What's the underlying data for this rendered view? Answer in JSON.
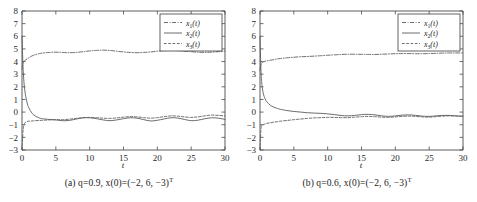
{
  "figure": {
    "panels": [
      {
        "tag": "(a)",
        "caption_text": "(a)  q=0.9, x(0)=(−2, 6, −3)",
        "caption_sup": "T",
        "q": 0.9
      },
      {
        "tag": "(b)",
        "caption_text": "(b)  q=0.6, x(0)=(−2, 6, −3)",
        "caption_sup": "T",
        "q": 0.6
      }
    ]
  },
  "legend": {
    "entries": [
      {
        "base": "x",
        "sub": "1",
        "suffix": "(t)",
        "style": "dashdot"
      },
      {
        "base": "x",
        "sub": "2",
        "suffix": "(t)",
        "style": "solid"
      },
      {
        "base": "x",
        "sub": "3",
        "suffix": "(t)",
        "style": "dashed"
      }
    ]
  },
  "axes": {
    "xlabel": "t",
    "ylabel": "",
    "xticks": [
      "0",
      "5",
      "10",
      "15",
      "20",
      "25",
      "30"
    ],
    "yticks": [
      "8",
      "7",
      "6",
      "5",
      "4",
      "3",
      "2",
      "1",
      "0",
      "−1",
      "−2",
      "−3"
    ],
    "xlim": [
      0,
      30
    ],
    "ylim": [
      -3,
      8
    ],
    "grid": false
  },
  "colors": {
    "axis": "#4a4a4a",
    "curve": "#5c5c5c",
    "text": "#1f1f1f",
    "background": "#ffffff"
  },
  "chart_data": [
    {
      "type": "line",
      "title": "(a) q=0.9, x(0)=(-2, 6, -3)T",
      "xlabel": "t",
      "ylabel": "",
      "xlim": [
        0,
        30
      ],
      "ylim": [
        -3,
        8
      ],
      "grid": false,
      "legend_position": "top-right",
      "x": [
        0,
        0.15,
        0.3,
        0.5,
        0.75,
        1,
        1.5,
        2,
        2.5,
        3,
        4,
        5,
        6,
        7,
        8,
        9,
        10,
        11,
        12,
        13,
        14,
        15,
        16,
        17,
        18,
        19,
        20,
        21,
        22,
        23,
        24,
        25,
        26,
        27,
        28,
        29,
        30
      ],
      "series": [
        {
          "name": "x1(t)",
          "style": "dashdot",
          "values": [
            3.4,
            3.85,
            4.0,
            4.12,
            4.2,
            4.3,
            4.45,
            4.55,
            4.62,
            4.67,
            4.72,
            4.74,
            4.72,
            4.7,
            4.72,
            4.78,
            4.84,
            4.88,
            4.9,
            4.88,
            4.82,
            4.76,
            4.72,
            4.7,
            4.72,
            4.76,
            4.82,
            4.86,
            4.88,
            4.86,
            4.82,
            4.78,
            4.74,
            4.72,
            4.74,
            4.78,
            4.82
          ]
        },
        {
          "name": "x2(t)",
          "style": "solid",
          "values": [
            6.0,
            3.6,
            2.3,
            1.4,
            0.75,
            0.35,
            -0.1,
            -0.32,
            -0.45,
            -0.52,
            -0.58,
            -0.62,
            -0.68,
            -0.66,
            -0.55,
            -0.46,
            -0.45,
            -0.52,
            -0.62,
            -0.68,
            -0.62,
            -0.52,
            -0.45,
            -0.48,
            -0.6,
            -0.7,
            -0.65,
            -0.54,
            -0.45,
            -0.47,
            -0.58,
            -0.68,
            -0.64,
            -0.53,
            -0.45,
            -0.48,
            -0.58
          ]
        },
        {
          "name": "x3(t)",
          "style": "dashed",
          "values": [
            -3.0,
            -1.5,
            -1.0,
            -0.82,
            -0.75,
            -0.72,
            -0.7,
            -0.68,
            -0.66,
            -0.65,
            -0.62,
            -0.6,
            -0.6,
            -0.56,
            -0.5,
            -0.44,
            -0.42,
            -0.44,
            -0.48,
            -0.5,
            -0.46,
            -0.4,
            -0.36,
            -0.38,
            -0.44,
            -0.48,
            -0.44,
            -0.36,
            -0.3,
            -0.32,
            -0.38,
            -0.42,
            -0.38,
            -0.3,
            -0.24,
            -0.26,
            -0.3
          ]
        }
      ]
    },
    {
      "type": "line",
      "title": "(b) q=0.6, x(0)=(-2, 6, -3)T",
      "xlabel": "t",
      "ylabel": "",
      "xlim": [
        0,
        30
      ],
      "ylim": [
        -3,
        8
      ],
      "grid": false,
      "legend_position": "top-right",
      "x": [
        0,
        0.15,
        0.3,
        0.5,
        0.75,
        1,
        1.5,
        2,
        2.5,
        3,
        4,
        5,
        6,
        7,
        8,
        9,
        10,
        11,
        12,
        13,
        14,
        15,
        16,
        17,
        18,
        19,
        20,
        21,
        22,
        23,
        24,
        25,
        26,
        27,
        28,
        29,
        30
      ],
      "series": [
        {
          "name": "x1(t)",
          "style": "dashdot",
          "values": [
            3.3,
            3.75,
            3.9,
            3.98,
            4.02,
            4.05,
            4.1,
            4.15,
            4.2,
            4.24,
            4.3,
            4.34,
            4.38,
            4.4,
            4.43,
            4.46,
            4.5,
            4.53,
            4.56,
            4.58,
            4.58,
            4.57,
            4.56,
            4.56,
            4.58,
            4.6,
            4.62,
            4.63,
            4.63,
            4.62,
            4.62,
            4.63,
            4.65,
            4.67,
            4.68,
            4.68,
            4.68
          ]
        },
        {
          "name": "x2(t)",
          "style": "solid",
          "values": [
            6.0,
            3.2,
            2.1,
            1.45,
            1.05,
            0.82,
            0.55,
            0.4,
            0.3,
            0.22,
            0.12,
            0.05,
            0.0,
            -0.05,
            -0.08,
            -0.1,
            -0.14,
            -0.2,
            -0.27,
            -0.3,
            -0.26,
            -0.2,
            -0.18,
            -0.22,
            -0.3,
            -0.34,
            -0.3,
            -0.24,
            -0.22,
            -0.26,
            -0.32,
            -0.34,
            -0.3,
            -0.26,
            -0.26,
            -0.3,
            -0.32
          ]
        },
        {
          "name": "x3(t)",
          "style": "dashed",
          "values": [
            -3.0,
            -1.3,
            -1.05,
            -0.98,
            -0.94,
            -0.9,
            -0.85,
            -0.8,
            -0.76,
            -0.72,
            -0.66,
            -0.6,
            -0.55,
            -0.5,
            -0.46,
            -0.44,
            -0.42,
            -0.42,
            -0.44,
            -0.44,
            -0.4,
            -0.36,
            -0.34,
            -0.36,
            -0.4,
            -0.42,
            -0.38,
            -0.34,
            -0.32,
            -0.34,
            -0.38,
            -0.4,
            -0.36,
            -0.32,
            -0.3,
            -0.32,
            -0.34
          ]
        }
      ]
    }
  ]
}
